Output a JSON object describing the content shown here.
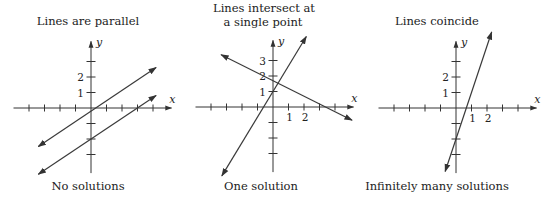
{
  "panels": [
    {
      "title_lines": [
        "Lines are parallel"
      ],
      "caption": "No solutions",
      "axis_labels": {
        "x": "x",
        "y": "y"
      },
      "y_tick_labels": [
        {
          "value": 1,
          "label": "1"
        },
        {
          "value": 2,
          "label": "2"
        }
      ],
      "x_tick_labels": []
    },
    {
      "title_lines": [
        "Lines intersect at",
        "a single point"
      ],
      "caption": "One solution",
      "axis_labels": {
        "x": "x",
        "y": "y"
      },
      "y_tick_labels": [
        {
          "value": 1,
          "label": "1"
        },
        {
          "value": 2,
          "label": "2"
        },
        {
          "value": 3,
          "label": "3"
        }
      ],
      "x_tick_labels": [
        {
          "value": 1,
          "label": "1"
        },
        {
          "value": 2,
          "label": "2"
        }
      ]
    },
    {
      "title_lines": [
        "Lines coincide"
      ],
      "caption": "Infinitely many solutions",
      "axis_labels": {
        "x": "x",
        "y": "y"
      },
      "y_tick_labels": [
        {
          "value": 1,
          "label": "1"
        },
        {
          "value": 2,
          "label": "2"
        }
      ],
      "x_tick_labels": [
        {
          "value": 1,
          "label": "1"
        },
        {
          "value": 2,
          "label": "2"
        }
      ]
    }
  ],
  "chart_data": [
    {
      "type": "line",
      "title": "Lines are parallel",
      "caption": "No solutions",
      "xlabel": "x",
      "ylabel": "y",
      "xlim": [
        -5,
        5
      ],
      "ylim": [
        -4,
        4
      ],
      "x_ticks": [
        -4,
        -3,
        -2,
        -1,
        1,
        2,
        3,
        4
      ],
      "y_ticks": [
        -3,
        -2,
        -1,
        1,
        2,
        3
      ],
      "grid": false,
      "series": [
        {
          "name": "line 1",
          "slope": 0.67,
          "intercept": -0.2,
          "x_range": [
            -3.4,
            4.2
          ]
        },
        {
          "name": "line 2",
          "slope": 0.67,
          "intercept": -2.0,
          "x_range": [
            -3.4,
            4.2
          ]
        }
      ]
    },
    {
      "type": "line",
      "title": "Lines intersect at a single point",
      "caption": "One solution",
      "xlabel": "x",
      "ylabel": "y",
      "xlim": [
        -5,
        5
      ],
      "ylim": [
        -4,
        4
      ],
      "x_ticks": [
        -4,
        -3,
        -2,
        -1,
        1,
        2,
        3,
        4
      ],
      "y_ticks": [
        -3,
        -2,
        -1,
        1,
        2,
        3
      ],
      "grid": false,
      "series": [
        {
          "name": "increasing line",
          "slope": 1.65,
          "intercept": 1.0,
          "x_range": [
            -3.3,
            2.15
          ]
        },
        {
          "name": "decreasing line",
          "slope": -0.5,
          "intercept": 1.7,
          "x_range": [
            -3.35,
            5.1
          ]
        }
      ],
      "intersection": [
        0.3,
        1.5
      ]
    },
    {
      "type": "line",
      "title": "Lines coincide",
      "caption": "Infinitely many solutions",
      "xlabel": "x",
      "ylabel": "y",
      "xlim": [
        -5,
        5
      ],
      "ylim": [
        -4,
        4
      ],
      "x_ticks": [
        -4,
        -3,
        -2,
        -1,
        1,
        2,
        3,
        4
      ],
      "y_ticks": [
        -3,
        -2,
        -1,
        1,
        2,
        3
      ],
      "grid": false,
      "series": [
        {
          "name": "coincident lines",
          "slope": 3.0,
          "intercept": -2.0,
          "x_range": [
            -0.7,
            2.3
          ]
        }
      ]
    }
  ]
}
